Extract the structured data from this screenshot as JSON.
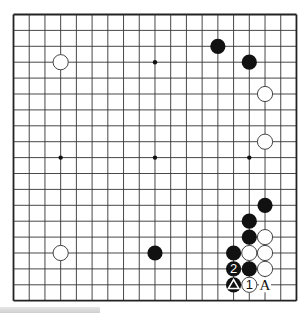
{
  "board": {
    "size": 19,
    "origin": {
      "x": 13.5,
      "y": 14.5
    },
    "spacing": {
      "x": 15.72,
      "y": 15.9
    },
    "line_color": "#333333",
    "border_color": "#222222",
    "background": "#ffffff",
    "star_points": [
      [
        3,
        3
      ],
      [
        9,
        3
      ],
      [
        15,
        3
      ],
      [
        3,
        9
      ],
      [
        9,
        9
      ],
      [
        15,
        9
      ],
      [
        3,
        15
      ],
      [
        9,
        15
      ],
      [
        15,
        15
      ]
    ]
  },
  "stones": [
    {
      "color": "white",
      "col": 3,
      "row": 3,
      "label": ""
    },
    {
      "color": "black",
      "col": 13,
      "row": 2,
      "label": ""
    },
    {
      "color": "black",
      "col": 15,
      "row": 3,
      "label": ""
    },
    {
      "color": "white",
      "col": 16,
      "row": 5,
      "label": ""
    },
    {
      "color": "white",
      "col": 16,
      "row": 8,
      "label": ""
    },
    {
      "color": "black",
      "col": 16,
      "row": 12,
      "label": ""
    },
    {
      "color": "black",
      "col": 15,
      "row": 13,
      "label": ""
    },
    {
      "color": "black",
      "col": 15,
      "row": 14,
      "label": ""
    },
    {
      "color": "white",
      "col": 16,
      "row": 14,
      "label": ""
    },
    {
      "color": "black",
      "col": 14,
      "row": 15,
      "label": ""
    },
    {
      "color": "white",
      "col": 15,
      "row": 15,
      "label": ""
    },
    {
      "color": "white",
      "col": 16,
      "row": 15,
      "label": ""
    },
    {
      "color": "black",
      "col": 14,
      "row": 16,
      "label": "2"
    },
    {
      "color": "black",
      "col": 15,
      "row": 16,
      "label": ""
    },
    {
      "color": "white",
      "col": 16,
      "row": 16,
      "label": ""
    },
    {
      "color": "black",
      "col": 14,
      "row": 17,
      "label": "triangle"
    },
    {
      "color": "white",
      "col": 15,
      "row": 17,
      "label": "1"
    },
    {
      "color": "black",
      "col": 9,
      "row": 15,
      "label": ""
    },
    {
      "color": "white",
      "col": 3,
      "row": 15,
      "label": ""
    }
  ],
  "annotations": [
    {
      "text": "A",
      "col": 16,
      "row": 17
    }
  ]
}
